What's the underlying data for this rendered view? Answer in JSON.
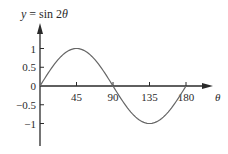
{
  "chart_data": {
    "type": "line",
    "title": "y = sin 2θ",
    "xlabel": "θ",
    "ylabel": "y",
    "function": "sin(2θ), θ in degrees",
    "x_ticks": [
      45,
      90,
      135,
      180
    ],
    "x_tick_labels": [
      "45",
      "90",
      "135",
      "180"
    ],
    "y_ticks": [
      1,
      0.5,
      0,
      -0.5,
      -1
    ],
    "y_tick_labels": [
      "1",
      "0.5",
      "0",
      "−0.5",
      "−1"
    ],
    "xlim": [
      0,
      180
    ],
    "ylim": [
      -1,
      1
    ],
    "grid": false,
    "legend": null,
    "series": [
      {
        "name": "y = sin 2θ",
        "x": [
          0,
          15,
          30,
          45,
          60,
          75,
          90,
          105,
          120,
          135,
          150,
          165,
          180
        ],
        "values": [
          0,
          0.5,
          0.866,
          1,
          0.866,
          0.5,
          0,
          -0.5,
          -0.866,
          -1,
          -0.866,
          -0.5,
          0
        ]
      }
    ],
    "colors": {
      "axis": "#2a2a2a",
      "curve": "#666666"
    }
  }
}
